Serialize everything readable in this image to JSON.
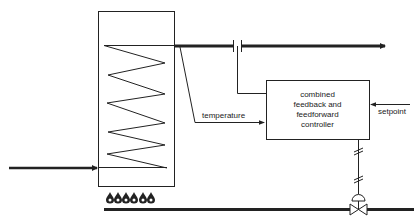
{
  "diagram": {
    "type": "process-control-schematic",
    "colors": {
      "line": "#222222",
      "background": "#ffffff"
    },
    "nodes": {
      "furnace": {
        "shape": "rectangle",
        "contains": "heating-coil"
      },
      "controller": {
        "shape": "rectangle",
        "lines": [
          "combined",
          "feedback and",
          "feedforward",
          "controller"
        ]
      },
      "flow_element": {
        "shape": "orifice-break-symbol"
      },
      "control_valve": {
        "shape": "valve-with-diaphragm-actuator"
      },
      "burners": {
        "count": 6,
        "icon": "flame-icon"
      }
    },
    "labels": {
      "temperature": "temperature",
      "setpoint": "setpoint"
    },
    "edges": [
      {
        "from": "inlet",
        "to": "furnace",
        "style": "thick-arrow"
      },
      {
        "from": "furnace",
        "to": "outlet",
        "style": "thick-arrow"
      },
      {
        "from": "furnace-outlet",
        "to": "controller",
        "label": "temperature",
        "style": "thin-arrow"
      },
      {
        "from": "flow_element",
        "to": "controller",
        "style": "thin-line"
      },
      {
        "from": "setpoint",
        "to": "controller",
        "label": "setpoint",
        "style": "thin-arrow"
      },
      {
        "from": "controller",
        "to": "control_valve",
        "style": "electric-signal"
      },
      {
        "from": "fuel-supply",
        "to": "burners",
        "style": "thick-line"
      }
    ]
  }
}
